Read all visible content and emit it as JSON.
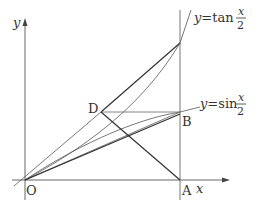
{
  "diagram": {
    "axes": {
      "x_label": "x",
      "y_label": "y",
      "origin_label": "O"
    },
    "points": {
      "A": {
        "label": "A",
        "px": [
          180,
          180
        ]
      },
      "B": {
        "label": "B",
        "px": [
          180,
          112
        ]
      },
      "D": {
        "label": "D",
        "px": [
          101,
          112
        ]
      },
      "T": {
        "label": "",
        "px": [
          180,
          43
        ]
      }
    },
    "curves": {
      "tan": {
        "label_prefix": "y=tan",
        "frac_num": "x",
        "frac_den": "2"
      },
      "sin": {
        "label_prefix": "y=sin",
        "frac_num": "x",
        "frac_den": "2"
      }
    },
    "colors": {
      "stroke": "#333333",
      "thin": "#555555",
      "axis": "#666666"
    }
  }
}
